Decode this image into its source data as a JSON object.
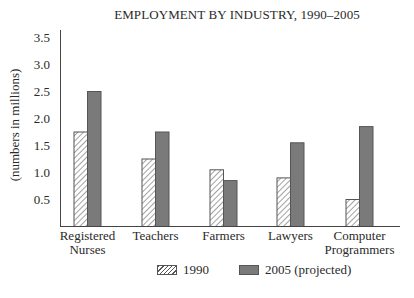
{
  "chart_data": {
    "type": "bar",
    "title": "EMPLOYMENT BY INDUSTRY, 1990–2005",
    "xlabel": "",
    "ylabel": "(numbers in millions)",
    "ylim": [
      0,
      3.5
    ],
    "yticks": [
      "0.5",
      "1.0",
      "1.5",
      "2.0",
      "2.5",
      "3.0",
      "3.5"
    ],
    "grid": false,
    "legend_position": "bottom",
    "categories": [
      "Registered Nurses",
      "Teachers",
      "Farmers",
      "Lawyers",
      "Computer Programmers"
    ],
    "category_labels": [
      [
        "Registered",
        "Nurses"
      ],
      [
        "Teachers"
      ],
      [
        "Farmers"
      ],
      [
        "Lawyers"
      ],
      [
        "Computer",
        "Programmers"
      ]
    ],
    "series": [
      {
        "name": "1990",
        "style": "hatched",
        "values": [
          1.75,
          1.25,
          1.05,
          0.9,
          0.5
        ]
      },
      {
        "name": "2005 (projected)",
        "style": "solid",
        "color": "#7a7a7a",
        "values": [
          2.5,
          1.75,
          0.85,
          1.55,
          1.85
        ]
      }
    ]
  },
  "legend": {
    "items": [
      {
        "label": "1990"
      },
      {
        "label": "2005 (projected)"
      }
    ]
  }
}
